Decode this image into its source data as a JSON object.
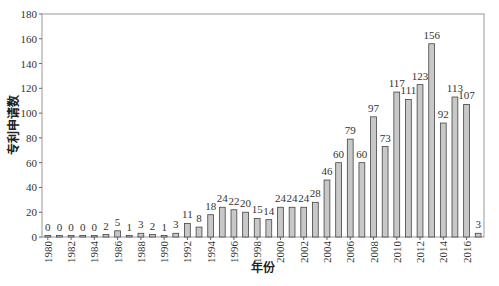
{
  "chart_data": {
    "type": "bar",
    "title": "",
    "xlabel": "年份",
    "ylabel": "专利申请数",
    "ylim": [
      0,
      180
    ],
    "yticks": [
      0,
      20,
      40,
      60,
      80,
      100,
      120,
      140,
      160,
      180
    ],
    "xtick_labels": [
      "1980",
      "1982",
      "1984",
      "1986",
      "1988",
      "1990",
      "1992",
      "1994",
      "1996",
      "1998",
      "2000",
      "2002",
      "2004",
      "2006",
      "2008",
      "2010",
      "2012",
      "2014",
      "2016"
    ],
    "categories": [
      "1980",
      "1981",
      "1982",
      "1983",
      "1984",
      "1985",
      "1986",
      "1987",
      "1988",
      "1989",
      "1990",
      "1991",
      "1992",
      "1993",
      "1994",
      "1995",
      "1996",
      "1997",
      "1998",
      "1999",
      "2000",
      "2001",
      "2002",
      "2003",
      "2004",
      "2005",
      "2006",
      "2007",
      "2008",
      "2009",
      "2010",
      "2011",
      "2012",
      "2013",
      "2014",
      "2015",
      "2016",
      "2017"
    ],
    "values": [
      0,
      0,
      0,
      0,
      0,
      2,
      5,
      1,
      3,
      2,
      1,
      3,
      11,
      8,
      18,
      24,
      22,
      20,
      15,
      14,
      24,
      24,
      24,
      28,
      46,
      60,
      79,
      60,
      97,
      73,
      117,
      111,
      123,
      156,
      92,
      113,
      107,
      3
    ],
    "bar_fill": "#c8c8c8",
    "bar_stroke": "#444444",
    "grid": false,
    "legend": null
  }
}
